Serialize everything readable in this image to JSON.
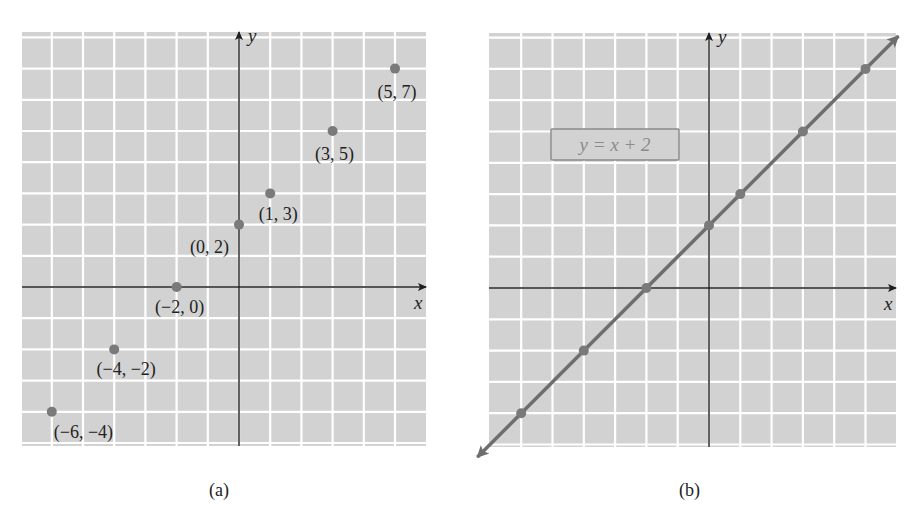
{
  "colors": {
    "grid_bg": "#d2d2d2",
    "grid_line": "#ffffff",
    "axis": "#1e1e1e",
    "point": "#7a7a7a",
    "line": "#6e6e6e",
    "text": "#222222"
  },
  "panels": [
    {
      "id": "a",
      "caption": "(a)",
      "x_axis_label": "x",
      "y_axis_label": "y",
      "points": [
        {
          "x": -6,
          "y": -4,
          "label": "(−6, −4)"
        },
        {
          "x": -4,
          "y": -2,
          "label": "(−4, −2)"
        },
        {
          "x": -2,
          "y": 0,
          "label": "(−2, 0)"
        },
        {
          "x": 0,
          "y": 2,
          "label": "(0, 2)"
        },
        {
          "x": 1,
          "y": 3,
          "label": "(1, 3)"
        },
        {
          "x": 3,
          "y": 5,
          "label": "(3, 5)"
        },
        {
          "x": 5,
          "y": 7,
          "label": "(5, 7)"
        }
      ]
    },
    {
      "id": "b",
      "caption": "(b)",
      "x_axis_label": "x",
      "y_axis_label": "y",
      "equation": "y = x + 2",
      "points": [
        {
          "x": -6,
          "y": -4
        },
        {
          "x": -4,
          "y": -2
        },
        {
          "x": -2,
          "y": 0
        },
        {
          "x": 0,
          "y": 2
        },
        {
          "x": 1,
          "y": 3
        },
        {
          "x": 3,
          "y": 5
        },
        {
          "x": 5,
          "y": 7
        }
      ]
    }
  ],
  "chart_data": [
    {
      "type": "scatter",
      "title": "(a)",
      "xlabel": "x",
      "ylabel": "y",
      "xlim": [
        -7,
        6
      ],
      "ylim": [
        -5,
        8
      ],
      "grid": true,
      "series": [
        {
          "name": "points",
          "x": [
            -6,
            -4,
            -2,
            0,
            1,
            3,
            5
          ],
          "y": [
            -4,
            -2,
            0,
            2,
            3,
            5,
            7
          ],
          "labels": [
            "(−6, −4)",
            "(−4, −2)",
            "(−2, 0)",
            "(0, 2)",
            "(1, 3)",
            "(3, 5)",
            "(5, 7)"
          ]
        }
      ]
    },
    {
      "type": "line",
      "title": "(b)",
      "xlabel": "x",
      "ylabel": "y",
      "xlim": [
        -7,
        6
      ],
      "ylim": [
        -5,
        8
      ],
      "grid": true,
      "annotations": [
        "y = x + 2"
      ],
      "series": [
        {
          "name": "y = x + 2",
          "x": [
            -6,
            -4,
            -2,
            0,
            1,
            3,
            5
          ],
          "y": [
            -4,
            -2,
            0,
            2,
            3,
            5,
            7
          ]
        }
      ]
    }
  ]
}
